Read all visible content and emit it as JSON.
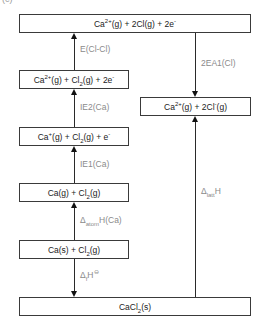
{
  "figure_label": "(c)",
  "levels": {
    "top": {
      "main": "Ca",
      "sup1": "2+",
      "mid": "(g) + 2Cl(g) + 2e",
      "sup2": "-"
    },
    "right": {
      "main": "Ca",
      "sup1": "2+",
      "mid": "(g) + 2Cl",
      "sup2": "-",
      "tail": "(g)"
    },
    "l2": {
      "main": "Ca",
      "sup1": "2+",
      "mid": "(g) + Cl",
      "sub": "2",
      "mid2": "(g) + 2e",
      "sup2": "-"
    },
    "l3": {
      "main": "Ca",
      "sup1": "+",
      "mid": "(g) + Cl",
      "sub": "2",
      "mid2": "(g) + e",
      "sup2": "-"
    },
    "l4": {
      "main": "Ca(g) + Cl",
      "sub": "2",
      "tail": "(g)"
    },
    "l5": {
      "main": "Ca(s) + Cl",
      "sub": "2",
      "tail": "(g)"
    },
    "bottom": {
      "main": "CaCl",
      "sub": "2",
      "tail": "(s)"
    }
  },
  "transitions": {
    "bond_energy": "E(Cl-Cl)",
    "electron_affinity": "2EA1(Cl)",
    "ie2": "IE2(Ca)",
    "ie1": "IE1(Ca)",
    "atomisation": {
      "delta": "Δ",
      "sub": "atom",
      "tail": "H(Ca)"
    },
    "formation": {
      "delta": "Δ",
      "sub": "f",
      "tail": "H",
      "sup": "⊖"
    },
    "lattice": {
      "delta": "Δ",
      "sub": "latt",
      "tail": "H"
    }
  },
  "colors": {
    "box_border": "#3a3a3a",
    "label_text": "#8a8a8a",
    "box_text": "#222222"
  }
}
